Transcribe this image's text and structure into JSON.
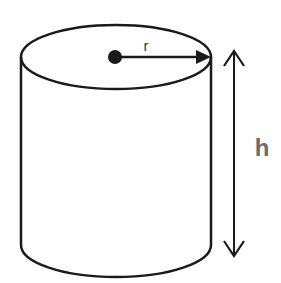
{
  "diagram": {
    "labels": {
      "radius": "r",
      "height": "h"
    },
    "colors": {
      "stroke": "#1a1a1a",
      "height_label": "#6b6b6b",
      "background": "#ffffff"
    }
  }
}
